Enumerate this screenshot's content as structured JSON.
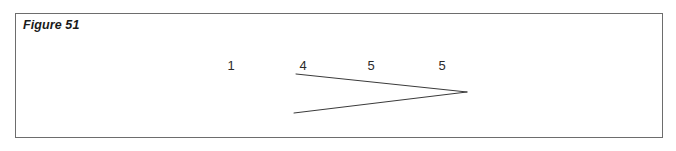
{
  "figure": {
    "caption": "Figure 51",
    "frame": {
      "stroke_color": "#6d6d6d",
      "fill_color": "#ffffff"
    },
    "page_background": "#ffffff"
  },
  "chart_data": {
    "type": "diagram",
    "title": "Figure 51",
    "stroke_color": "#3a3a3a",
    "stroke_width": 1,
    "labels": [
      {
        "text": "1",
        "x": 230,
        "y": 64
      },
      {
        "text": "4",
        "x": 302,
        "y": 64
      },
      {
        "text": "5",
        "x": 370,
        "y": 64
      },
      {
        "text": "5",
        "x": 441,
        "y": 64
      }
    ],
    "segments": [
      {
        "name": "upper-ray",
        "x1": 295,
        "y1": 74,
        "x2": 466,
        "y2": 92
      },
      {
        "name": "lower-ray",
        "x1": 466,
        "y1": 92,
        "x2": 293,
        "y2": 113
      }
    ],
    "vertex": {
      "x": 466,
      "y": 92
    }
  }
}
